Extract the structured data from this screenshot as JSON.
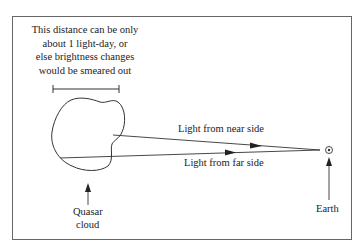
{
  "diagram": {
    "caption_lines": [
      "This distance can be only",
      "about 1 light-day, or",
      "else brightness changes",
      "would be smeared out"
    ],
    "near_label": "Light from near side",
    "far_label": "Light from far side",
    "quasar_label_1": "Quasar",
    "quasar_label_2": "cloud",
    "earth_label": "Earth",
    "line_color": "#333333"
  }
}
